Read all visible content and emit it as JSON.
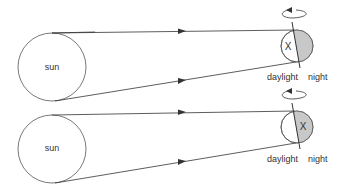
{
  "diagrams": [
    {
      "sun_label": "sun",
      "planet_label": "X",
      "x_position": "daylight",
      "daylight_label": "daylight",
      "night_label": "night"
    },
    {
      "sun_label": "sun",
      "planet_label": "X",
      "x_position": "night",
      "daylight_label": "daylight",
      "night_label": "night"
    }
  ],
  "colors": {
    "line": "#333333",
    "night_fill": "#c8c8c8",
    "background": "#ffffff"
  }
}
